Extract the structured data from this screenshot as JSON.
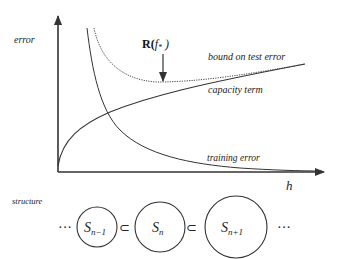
{
  "axes": {
    "y_label": "error",
    "x_label": "h"
  },
  "annotations": {
    "risk_label_main": "R(",
    "risk_label_f": "f",
    "risk_label_sub": "*",
    "risk_label_close": " )"
  },
  "curves": {
    "bound": "bound on test error",
    "capacity": "capacity term",
    "training": "training error"
  },
  "structure": {
    "label": "structure",
    "ellipsis_left": "···",
    "ellipsis_right": "···",
    "subset_symbol": "⊂",
    "sets": [
      {
        "base": "S",
        "sub": "n−1"
      },
      {
        "base": "S",
        "sub": "n"
      },
      {
        "base": "S",
        "sub": "n+1"
      }
    ]
  },
  "colors": {
    "line": "#333333",
    "text": "#222222",
    "background": "#ffffff"
  }
}
